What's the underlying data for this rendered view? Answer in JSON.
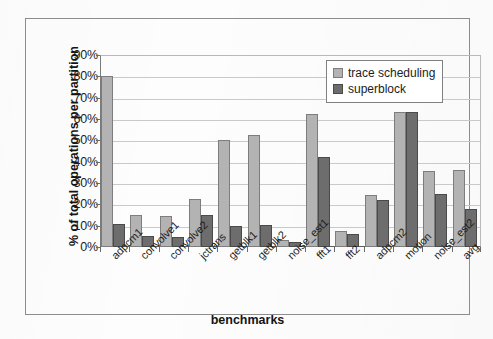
{
  "chart_data": {
    "type": "bar",
    "title": "",
    "xlabel": "benchmarks",
    "ylabel": "% of total operations per partition",
    "ylim": [
      0,
      90
    ],
    "ytick_labels": [
      "90%",
      "80%",
      "70%",
      "60%",
      "50%",
      "40%",
      "30%",
      "20%",
      "10%",
      "0%"
    ],
    "ytick_values": [
      90,
      80,
      70,
      60,
      50,
      40,
      30,
      20,
      10,
      0
    ],
    "grid": true,
    "legend_position": "top-right",
    "categories": [
      "adpcm1",
      "convolve1",
      "convolve2",
      "jctrans",
      "getblk1",
      "getblk2",
      "noise_est1",
      "fft1",
      "fft2",
      "adpcm2",
      "motion",
      "noise_est2",
      "avg"
    ],
    "series": [
      {
        "name": "trace scheduling",
        "color": "#b3b3b3",
        "values": [
          80.0,
          15.0,
          14.5,
          22.5,
          50.0,
          52.5,
          3.5,
          62.5,
          7.5,
          24.5,
          63.5,
          35.5,
          36.0
        ]
      },
      {
        "name": "superblock",
        "color": "#6d6d6d",
        "values": [
          11.0,
          5.0,
          4.5,
          15.0,
          10.0,
          10.5,
          2.5,
          42.0,
          6.0,
          22.0,
          63.5,
          25.0,
          18.0
        ]
      }
    ]
  }
}
